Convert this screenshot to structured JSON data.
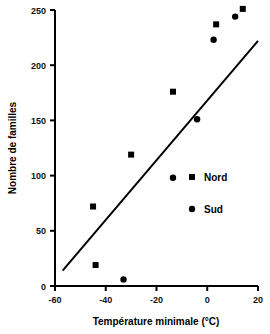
{
  "chart_data": {
    "type": "scatter",
    "title": "",
    "xlabel": "Température minimale (°C)",
    "ylabel": "Nombre de familles",
    "xlim": [
      -60,
      20
    ],
    "ylim": [
      0,
      250
    ],
    "xticks": [
      -60,
      -40,
      -20,
      0,
      20
    ],
    "yticks": [
      0,
      50,
      100,
      150,
      200,
      250
    ],
    "xtick_labels": [
      "-60",
      "-40",
      "-20",
      "0",
      "20"
    ],
    "ytick_labels": [
      "0",
      "50",
      "100",
      "150",
      "200",
      "250"
    ],
    "grid": false,
    "legend_position": "center-right",
    "series": [
      {
        "name": "Nord",
        "marker": "square",
        "color": "#000000",
        "points": [
          {
            "x": -45,
            "y": 72
          },
          {
            "x": -44,
            "y": 19
          },
          {
            "x": -30,
            "y": 119
          },
          {
            "x": -13.5,
            "y": 176
          },
          {
            "x": 3.5,
            "y": 237
          },
          {
            "x": 14,
            "y": 251
          }
        ]
      },
      {
        "name": "Sud",
        "marker": "circle",
        "color": "#000000",
        "points": [
          {
            "x": -33,
            "y": 6
          },
          {
            "x": -13.5,
            "y": 98
          },
          {
            "x": -4,
            "y": 151
          },
          {
            "x": 2.5,
            "y": 223
          },
          {
            "x": 11,
            "y": 244
          }
        ]
      }
    ],
    "trend_line": {
      "name": "regression-line",
      "color": "#000000",
      "x_start": -57,
      "y_start": 14,
      "x_end": 20,
      "y_end": 222
    }
  },
  "legend": {
    "entries": [
      {
        "label": "Nord",
        "marker": "square"
      },
      {
        "label": "Sud",
        "marker": "circle"
      }
    ]
  },
  "axes": {
    "x_title": "Température minimale (°C)",
    "y_title": "Nombre de familles"
  }
}
